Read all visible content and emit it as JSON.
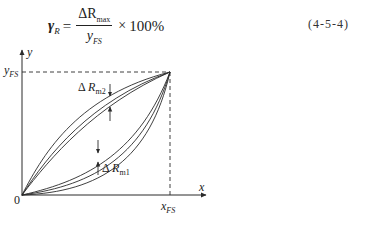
{
  "formula": {
    "lhs_symbol": "γ",
    "lhs_subscript": "R",
    "equals": "=",
    "numerator_symbol": "ΔR",
    "numerator_subscript": "max",
    "denominator_symbol": "y",
    "denominator_subscript": "FS",
    "times": "×",
    "factor": "100%",
    "equation_number": "(4-5-4)"
  },
  "diagram": {
    "y_axis_label": "y",
    "x_axis_label": "x",
    "origin_label": "0",
    "y_fs_label": {
      "symbol": "y",
      "subscript": "FS"
    },
    "x_fs_label": {
      "symbol": "x",
      "subscript": "FS"
    },
    "delta_rm2_label": {
      "delta": "Δ",
      "symbol": "R",
      "subscript": "m2"
    },
    "delta_rm1_label": {
      "delta": "Δ",
      "symbol": "R",
      "subscript": "m1"
    },
    "line_color": "#2a2a2a"
  }
}
